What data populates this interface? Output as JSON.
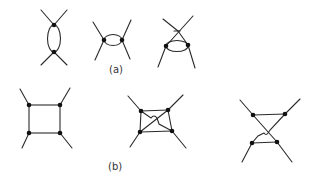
{
  "figure": {
    "labels": {
      "a": "(a)",
      "b": "(b)"
    },
    "colors": {
      "line": "#2a2a2a",
      "node": "#111111",
      "background": "#ffffff"
    },
    "row_a": {
      "diagrams": [
        {
          "name": "vertical-bubble-diagram",
          "nodes": [
            [
              54,
              25
            ],
            [
              54,
              52
            ]
          ]
        },
        {
          "name": "horizontal-bubble-diagram",
          "nodes": [
            [
              104,
              40
            ],
            [
              122,
              40
            ]
          ]
        },
        {
          "name": "crossed-bubble-diagram",
          "nodes": [
            [
              166,
              46
            ],
            [
              188,
              45
            ]
          ]
        }
      ]
    },
    "row_b": {
      "diagrams": [
        {
          "name": "box-diagram",
          "nodes": [
            [
              29,
              105
            ],
            [
              60,
              105
            ],
            [
              29,
              133
            ],
            [
              60,
              133
            ]
          ]
        },
        {
          "name": "crossed-box-diagram",
          "nodes": [
            [
              141,
              111
            ],
            [
              168,
              110
            ],
            [
              140,
              132
            ],
            [
              172,
              131
            ]
          ]
        },
        {
          "name": "twisted-box-diagram",
          "nodes": [
            [
              253,
              115
            ],
            [
              285,
              114
            ],
            [
              252,
              143
            ],
            [
              277,
              142
            ]
          ]
        }
      ]
    }
  }
}
